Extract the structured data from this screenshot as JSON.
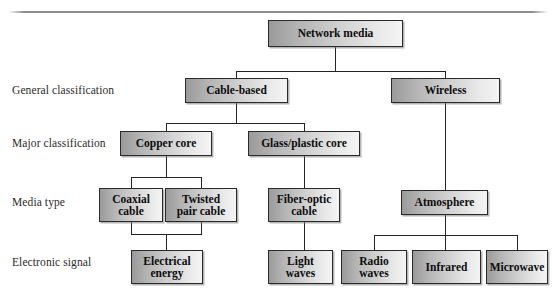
{
  "diagram": {
    "root": "Network media",
    "tier_labels": [
      "General classification",
      "Major classification",
      "Media type",
      "Electronic signal"
    ],
    "nodes": {
      "network_media": "Network media",
      "cable_based": "Cable-based",
      "wireless": "Wireless",
      "copper_core": "Copper core",
      "glass_plastic_core": "Glass/plastic core",
      "coaxial_cable_line1": "Coaxial",
      "coaxial_cable_line2": "cable",
      "twisted_pair_line1": "Twisted",
      "twisted_pair_line2": "pair cable",
      "fiber_optic_line1": "Fiber-optic",
      "fiber_optic_line2": "cable",
      "atmosphere": "Atmosphere",
      "electrical_energy_line1": "Electrical",
      "electrical_energy_line2": "energy",
      "light_waves_line1": "Light",
      "light_waves_line2": "waves",
      "radio_waves_line1": "Radio",
      "radio_waves_line2": "waves",
      "infrared": "Infrared",
      "microwave": "Microwave"
    },
    "colors": {
      "box_border": "#2a2a2a",
      "box_fill_dark": "#9a9a9a",
      "box_fill_light": "#f4f4f4",
      "connector": "#242424",
      "label_text": "#2b2b2b",
      "node_text": "#0d0d0d",
      "background": "#ffffff"
    }
  }
}
